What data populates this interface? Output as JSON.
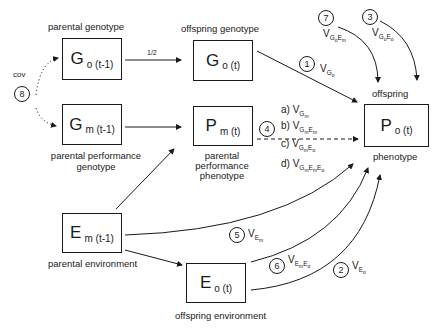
{
  "nodes": {
    "go_t1": {
      "main": "G",
      "sub": "o (t-1)",
      "label_top": "parental genotype"
    },
    "gm_t1": {
      "main": "G",
      "sub": "m (t-1)",
      "label_bottom_1": "parental performance",
      "label_bottom_2": "genotype"
    },
    "go_t": {
      "main": "G",
      "sub": "o (t)",
      "label_top": "offspring genotype"
    },
    "pm_t": {
      "main": "P",
      "sub": "m (t)",
      "label_bottom_1": "parental",
      "label_bottom_2": "performance",
      "label_bottom_3": "phenotype"
    },
    "po_t": {
      "main": "P",
      "sub": "o (t)",
      "label_top": "offspring",
      "label_bottom": "phenotype"
    },
    "em_t1": {
      "main": "E",
      "sub": "m (t-1)",
      "label_bottom": "parental environment"
    },
    "eo_t": {
      "main": "E",
      "sub": "o (t)",
      "label_bottom": "offspring environment"
    }
  },
  "edges": {
    "half_label": "1/2",
    "cov_label": "cov"
  },
  "paths": [
    {
      "num": "1",
      "v": "V",
      "sub": "G",
      "subsub": "o"
    },
    {
      "num": "2",
      "v": "V",
      "sub": "E",
      "subsub": "o"
    },
    {
      "num": "3",
      "v": "V",
      "sub": "G",
      "subsub": "o",
      "sub2": "E",
      "subsub2": "o"
    },
    {
      "num": "4"
    },
    {
      "num": "5",
      "v": "V",
      "sub": "E",
      "subsub": "m"
    },
    {
      "num": "6",
      "v": "V",
      "sub": "E",
      "subsub": "m",
      "sub2": "E",
      "subsub2": "o"
    },
    {
      "num": "7",
      "v": "V",
      "sub": "G",
      "subsub": "o",
      "sub2": "E",
      "subsub2": "m"
    },
    {
      "num": "8"
    }
  ],
  "path4_options": [
    {
      "letter": "a)",
      "v": "V",
      "text": "G",
      "s1": "m",
      "t2": "",
      "s2": "",
      "t3": "",
      "s3": ""
    },
    {
      "letter": "b)",
      "v": "V",
      "text": "G",
      "s1": "m",
      "t2": "E",
      "s2": "m",
      "t3": "",
      "s3": ""
    },
    {
      "letter": "c)",
      "v": "V",
      "text": "G",
      "s1": "m",
      "t2": "E",
      "s2": "o",
      "t3": "",
      "s3": ""
    },
    {
      "letter": "d)",
      "v": "V",
      "text": "G",
      "s1": "m",
      "t2": "E",
      "s2": "m",
      "t3": "E",
      "s3": "o"
    }
  ]
}
